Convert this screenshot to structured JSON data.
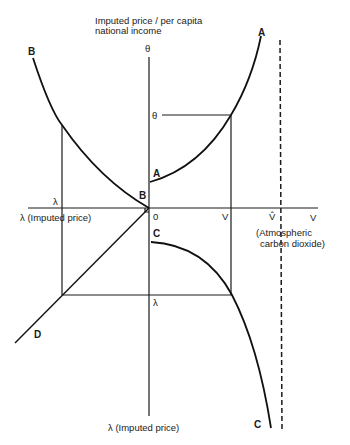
{
  "diagram": {
    "title_line1": "Imputed price / per capita",
    "title_line2": "national income",
    "axes": {
      "top_label": "θ",
      "left_label": "λ (Imputed price)",
      "bottom_label": "λ (Imputed price)",
      "right_label": "V",
      "right_sublabel_line1": "(Atmospheric",
      "right_sublabel_line2": "carbon dioxide)",
      "origin_label": "0"
    },
    "markers": {
      "theta": "θ",
      "lambda_left": "λ",
      "lambda_bottom": "λ",
      "v": "V",
      "v_hat": "V̂"
    },
    "curves": {
      "A_top": "A",
      "A_origin": "A",
      "B_top": "B",
      "B_origin": "B",
      "C_origin": "C",
      "C_bottom": "C",
      "D": "D"
    },
    "colors": {
      "ink": "#1a1a1a",
      "background": "#ffffff"
    }
  }
}
